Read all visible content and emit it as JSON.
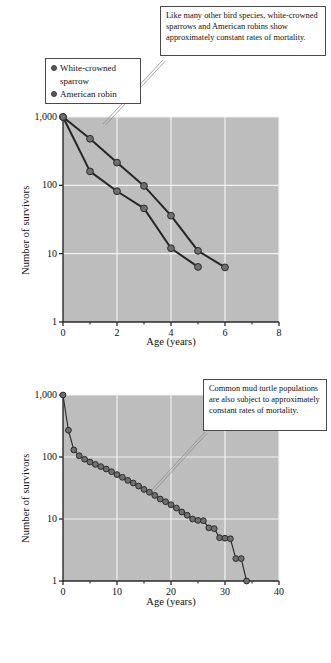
{
  "figure": {
    "panels": [
      {
        "id": "birds",
        "annotation": "Like many other bird species, white-crowned sparrows and American robins show approximately constant rates of mortality.",
        "legend": [
          {
            "label_line1": "White-crowned",
            "label_line2": "sparrow",
            "marker": "filled-circle"
          },
          {
            "label_line1": "American robin",
            "label_line2": "",
            "marker": "filled-circle"
          }
        ],
        "chart_data": {
          "type": "line",
          "title": "",
          "xlabel": "Age (years)",
          "ylabel": "Number of survivors",
          "xlim": [
            0,
            8
          ],
          "ylim": [
            1,
            1000
          ],
          "yscale": "log",
          "grid": true,
          "legend_position": "upper-left-inset",
          "xticks": [
            0,
            2,
            4,
            6,
            8
          ],
          "xtick_labels": [
            "0",
            "2",
            "4",
            "6",
            "8"
          ],
          "xminor_ticks": [
            1,
            3,
            5,
            7
          ],
          "yticks": [
            1,
            10,
            100,
            1000
          ],
          "ytick_labels": [
            "1",
            "10",
            "100",
            "1,000"
          ],
          "series": [
            {
              "name": "White-crowned sparrow",
              "x": [
                0,
                1,
                2,
                3,
                4,
                5,
                6
              ],
              "values": [
                1000,
                480,
                215,
                98,
                36,
                11,
                6.3
              ]
            },
            {
              "name": "American robin",
              "x": [
                0,
                1,
                2,
                3,
                4,
                5
              ],
              "values": [
                1000,
                160,
                82,
                46,
                12,
                6.4
              ]
            }
          ]
        }
      },
      {
        "id": "turtle",
        "annotation": "Common mud turtle populations are also subject to approximately constant rates of mortality.",
        "legend": [],
        "chart_data": {
          "type": "line",
          "title": "",
          "xlabel": "Age (years)",
          "ylabel": "Number of survivors",
          "xlim": [
            0,
            40
          ],
          "ylim": [
            1,
            1000
          ],
          "yscale": "log",
          "grid": true,
          "legend_position": "none",
          "xticks": [
            0,
            10,
            20,
            30,
            40
          ],
          "xtick_labels": [
            "0",
            "10",
            "20",
            "30",
            "40"
          ],
          "xminor_ticks": [
            5,
            15,
            25,
            35
          ],
          "yticks": [
            1,
            10,
            100,
            1000
          ],
          "ytick_labels": [
            "1",
            "10",
            "100",
            "1,000"
          ],
          "series": [
            {
              "name": "Common mud turtle",
              "x": [
                0,
                1,
                2,
                3,
                4,
                5,
                6,
                7,
                8,
                9,
                10,
                11,
                12,
                13,
                14,
                15,
                16,
                17,
                18,
                19,
                20,
                21,
                22,
                23,
                24,
                25,
                26,
                27,
                28,
                29,
                30,
                31,
                32,
                33,
                34
              ],
              "values": [
                1000,
                270,
                130,
                105,
                92,
                83,
                76,
                70,
                64,
                58,
                52,
                47,
                42,
                38,
                34,
                30,
                27,
                24,
                21,
                19,
                17,
                15,
                13,
                11.5,
                10,
                9.5,
                9.4,
                7.2,
                7.0,
                5.0,
                4.9,
                4.8,
                2.3,
                2.3,
                1
              ]
            }
          ]
        }
      }
    ]
  }
}
